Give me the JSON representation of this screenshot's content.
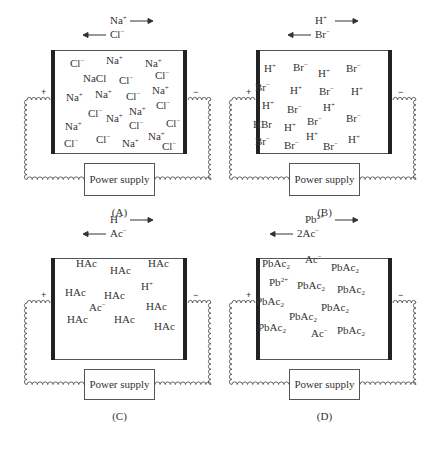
{
  "panels": [
    {
      "id": "A",
      "caption": "(A)",
      "migration": {
        "cation": "Na",
        "cation_charge": "+",
        "anion": "Cl",
        "anion_charge": "−",
        "anion_prefix": ""
      },
      "power_supply": "Power supply",
      "positive": "+",
      "negative": "−",
      "species": [
        {
          "t": "Cl",
          "sup": "−",
          "x": 70,
          "y": 58
        },
        {
          "t": "Na",
          "sup": "+",
          "x": 106,
          "y": 55
        },
        {
          "t": "Na",
          "sup": "+",
          "x": 145,
          "y": 58
        },
        {
          "t": "NaCl",
          "x": 83,
          "y": 73
        },
        {
          "t": "Cl",
          "sup": "−",
          "x": 119,
          "y": 75
        },
        {
          "t": "Cl",
          "sup": "−",
          "x": 155,
          "y": 70
        },
        {
          "t": "Na",
          "sup": "+",
          "x": 66,
          "y": 92
        },
        {
          "t": "Na",
          "sup": "+",
          "x": 95,
          "y": 89
        },
        {
          "t": "Cl",
          "sup": "−",
          "x": 126,
          "y": 91
        },
        {
          "t": "Na",
          "sup": "+",
          "x": 152,
          "y": 85
        },
        {
          "t": "Cl",
          "sup": "−",
          "x": 88,
          "y": 108
        },
        {
          "t": "Na",
          "sup": "+",
          "x": 106,
          "y": 113
        },
        {
          "t": "Na",
          "sup": "+",
          "x": 129,
          "y": 106
        },
        {
          "t": "Cl",
          "sup": "−",
          "x": 156,
          "y": 100
        },
        {
          "t": "Cl",
          "sup": "−",
          "x": 129,
          "y": 120
        },
        {
          "t": "Cl",
          "sup": "−",
          "x": 166,
          "y": 118
        },
        {
          "t": "Na",
          "sup": "+",
          "x": 65,
          "y": 121
        },
        {
          "t": "Na",
          "sup": "+",
          "x": 148,
          "y": 131
        },
        {
          "t": "Cl",
          "sup": "−",
          "x": 64,
          "y": 138
        },
        {
          "t": "Cl",
          "sup": "−",
          "x": 96,
          "y": 134
        },
        {
          "t": "Na",
          "sup": "+",
          "x": 122,
          "y": 138
        },
        {
          "t": "Cl",
          "sup": "−",
          "x": 162,
          "y": 141
        }
      ]
    },
    {
      "id": "B",
      "caption": "(B)",
      "migration": {
        "cation": "H",
        "cation_charge": "+",
        "anion": "Br",
        "anion_charge": "−",
        "anion_prefix": ""
      },
      "power_supply": "Power supply",
      "positive": "+",
      "negative": "−",
      "species": [
        {
          "t": "H",
          "sup": "+",
          "x": 59,
          "y": 63
        },
        {
          "t": "Br",
          "sup": "−",
          "x": 88,
          "y": 62
        },
        {
          "t": "H",
          "sup": "+",
          "x": 113,
          "y": 68
        },
        {
          "t": "Br",
          "sup": "−",
          "x": 141,
          "y": 63
        },
        {
          "t": "Br",
          "sup": "−",
          "x": 50,
          "y": 82
        },
        {
          "t": "H",
          "sup": "+",
          "x": 85,
          "y": 85
        },
        {
          "t": "Br",
          "sup": "−",
          "x": 114,
          "y": 86
        },
        {
          "t": "H",
          "sup": "+",
          "x": 146,
          "y": 86
        },
        {
          "t": "H",
          "sup": "+",
          "x": 57,
          "y": 100
        },
        {
          "t": "Br",
          "sup": "−",
          "x": 82,
          "y": 104
        },
        {
          "t": "H",
          "sup": "+",
          "x": 118,
          "y": 102
        },
        {
          "t": "HBr",
          "x": 48,
          "y": 119
        },
        {
          "t": "H",
          "sup": "+",
          "x": 79,
          "y": 122
        },
        {
          "t": "Br",
          "sup": "−",
          "x": 102,
          "y": 116
        },
        {
          "t": "Br",
          "sup": "−",
          "x": 141,
          "y": 113
        },
        {
          "t": "Br",
          "sup": "−",
          "x": 50,
          "y": 136
        },
        {
          "t": "Br",
          "sup": "−",
          "x": 79,
          "y": 140
        },
        {
          "t": "H",
          "sup": "+",
          "x": 101,
          "y": 131
        },
        {
          "t": "Br",
          "sup": "−",
          "x": 118,
          "y": 141
        },
        {
          "t": "H",
          "sup": "+",
          "x": 143,
          "y": 134
        }
      ]
    },
    {
      "id": "C",
      "caption": "(C)",
      "migration": {
        "cation": "H",
        "cation_charge": "+",
        "anion": "Ac",
        "anion_charge": "−",
        "anion_prefix": ""
      },
      "power_supply": "Power supply",
      "positive": "+",
      "negative": "−",
      "species": [
        {
          "t": "HAc",
          "x": 76,
          "y": 50
        },
        {
          "t": "HAc",
          "x": 110,
          "y": 57
        },
        {
          "t": "HAc",
          "x": 148,
          "y": 50
        },
        {
          "t": "H",
          "sup": "+",
          "x": 141,
          "y": 73
        },
        {
          "t": "HAc",
          "x": 65,
          "y": 79
        },
        {
          "t": "HAc",
          "x": 104,
          "y": 82
        },
        {
          "t": "Ac",
          "sup": "−",
          "x": 89,
          "y": 94
        },
        {
          "t": "HAc",
          "x": 146,
          "y": 93
        },
        {
          "t": "HAc",
          "x": 67,
          "y": 106
        },
        {
          "t": "HAc",
          "x": 114,
          "y": 106
        },
        {
          "t": "HAc",
          "x": 154,
          "y": 113
        }
      ]
    },
    {
      "id": "D",
      "caption": "(D)",
      "migration": {
        "cation": "Pb",
        "cation_charge": "2+",
        "anion": "Ac",
        "anion_charge": "−",
        "anion_prefix": "2"
      },
      "power_supply": "Power supply",
      "positive": "+",
      "negative": "−",
      "species": [
        {
          "t": "PbAc",
          "sub": "2",
          "x": 57,
          "y": 50
        },
        {
          "t": "Ac",
          "sup": "−",
          "x": 100,
          "y": 46
        },
        {
          "t": "PbAc",
          "sub": "2",
          "x": 126,
          "y": 54
        },
        {
          "t": "Pb",
          "sup": "2+",
          "x": 64,
          "y": 69
        },
        {
          "t": "PbAc",
          "sub": "2",
          "x": 92,
          "y": 72
        },
        {
          "t": "PbAc",
          "sub": "2",
          "x": 132,
          "y": 76
        },
        {
          "t": "PbAc",
          "sub": "2",
          "x": 51,
          "y": 88
        },
        {
          "t": "PbAc",
          "sub": "2",
          "x": 116,
          "y": 94
        },
        {
          "t": "PbAc",
          "sub": "2",
          "x": 84,
          "y": 103
        },
        {
          "t": "PbAc",
          "sub": "2",
          "x": 53,
          "y": 114
        },
        {
          "t": "Ac",
          "sup": "−",
          "x": 106,
          "y": 120
        },
        {
          "t": "PbAc",
          "sub": "2",
          "x": 132,
          "y": 117
        }
      ]
    }
  ]
}
